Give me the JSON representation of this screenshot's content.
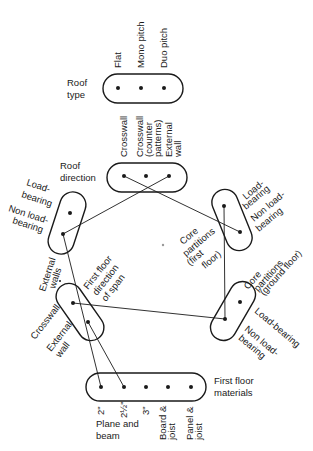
{
  "diagram": {
    "type": "morphological-compatibility-diagram",
    "nodes": {
      "roof_type": {
        "title_line1": "Roof",
        "title_line2": "type",
        "options": [
          "Flat",
          "Mono pitch",
          "Duo pitch"
        ]
      },
      "roof_direction": {
        "title_line1": "Roof",
        "title_line2": "direction",
        "options": {
          "o1": "Crosswall",
          "o2_l1": "Crosswall",
          "o2_l2": "(counter",
          "o2_l3": "patterns)",
          "o3_l1": "External",
          "o3_l2": "wall"
        }
      },
      "external_walls": {
        "title_line1": "External",
        "title_line2": "walls",
        "options": {
          "o1_l1": "Load-",
          "o1_l2": "bearing",
          "o2_l1": "Non load-",
          "o2_l2": "bearing"
        }
      },
      "core_first_floor": {
        "title_line1": "Core",
        "title_line2": "partitions",
        "title_line3": "(first",
        "title_line4": "floor)",
        "options": {
          "o1_l1": "Load-",
          "o1_l2": "bearing",
          "o2_l1": "Non load-",
          "o2_l2": "bearing"
        }
      },
      "first_floor_span": {
        "title_line1": "First floor",
        "title_line2": "direction",
        "title_line3": "of span",
        "options": {
          "o1": "Crosswall",
          "o2_l1": "External",
          "o2_l2": "wall"
        }
      },
      "core_ground_floor": {
        "title_line1": "Core",
        "title_line2": "partitions",
        "title_line3": "(ground floor)",
        "options": {
          "o1": "Load-bearing",
          "o2_l1": "Non load-",
          "o2_l2": "bearing"
        }
      },
      "first_floor_materials": {
        "title_line1": "First floor",
        "title_line2": "materials",
        "options": [
          "2\"",
          "2½\"",
          "3\"",
          "Board &",
          "Panel &"
        ],
        "option_sub": {
          "board": "joist",
          "panel": "joist"
        },
        "group_label_l1": "Plane and",
        "group_label_l2": "beam"
      }
    },
    "links": [
      {
        "from": "roof_direction.Crosswall",
        "to": "core_first_floor.Non load-bearing"
      },
      {
        "from": "roof_direction.External wall",
        "to": "external_walls.Non load-bearing"
      },
      {
        "from": "external_walls.Non load-bearing",
        "to": "first_floor_materials.2\""
      },
      {
        "from": "core_first_floor.Load-bearing",
        "to": "core_ground_floor.Non load-bearing"
      },
      {
        "from": "first_floor_span.Crosswall",
        "to": "core_ground_floor.Non load-bearing"
      },
      {
        "from": "first_floor_span.External wall",
        "to": "first_floor_materials.2½\""
      }
    ]
  }
}
